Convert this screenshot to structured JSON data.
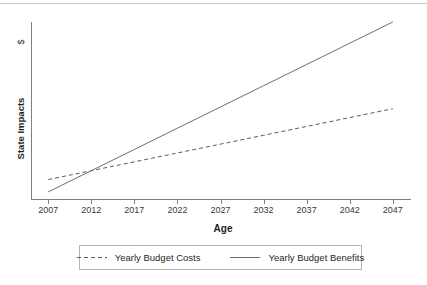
{
  "chart_data": {
    "type": "line",
    "title": "",
    "xlabel": "Age",
    "ylabel": "State Impacts",
    "y_unit_label": "$",
    "grid": false,
    "legend_position": "bottom",
    "x_tick_labels": [
      "2007",
      "2012",
      "2017",
      "2022",
      "2027",
      "2032",
      "2037",
      "2042",
      "2047"
    ],
    "x": [
      2007,
      2012,
      2017,
      2022,
      2027,
      2032,
      2037,
      2042,
      2047
    ],
    "xlim": [
      2005,
      2049
    ],
    "ylim": [
      0,
      100
    ],
    "y_axis_ticks_shown": false,
    "series": [
      {
        "name": "Yearly Budget Costs",
        "style": "dashed",
        "color": "#5a5a5a",
        "values": [
          11,
          16,
          21,
          26,
          31,
          36,
          41,
          46,
          51
        ]
      },
      {
        "name": "Yearly Budget Benefits",
        "style": "solid",
        "color": "#6e6e6e",
        "values": [
          4,
          16,
          28,
          40,
          52,
          64,
          76,
          88,
          100
        ]
      }
    ],
    "annotations": {
      "crossover_note": "Benefits line crosses above Costs line shortly after 2007"
    }
  },
  "legend": {
    "entries": [
      {
        "label": "Yearly Budget Costs",
        "style": "dashed"
      },
      {
        "label": "Yearly Budget Benefits",
        "style": "solid"
      }
    ]
  },
  "colors": {
    "axis": "#7f7f7f",
    "text": "#1f1f1f",
    "tick_text": "#3a3a3a",
    "legend_border": "#b5b5b5",
    "top_rule": "#c9c9c9",
    "background": "#ffffff"
  }
}
